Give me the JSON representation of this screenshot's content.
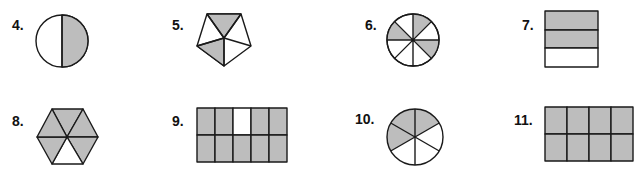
{
  "colors": {
    "shaded": "#bdbdbd",
    "unshaded": "#ffffff",
    "outline": "#1a1a1a"
  },
  "problems": [
    {
      "number": "4.",
      "shape": "circle",
      "parts": 2,
      "shaded": 1,
      "shaded_parts": [
        "right-half"
      ]
    },
    {
      "number": "5.",
      "shape": "pentagon",
      "parts": 5,
      "shaded": 2,
      "shaded_parts": [
        "top",
        "bottom-left"
      ]
    },
    {
      "number": "6.",
      "shape": "circle",
      "parts": 8,
      "shaded": 3,
      "shaded_parts": [
        "0-45deg",
        "90-135deg",
        "270-315deg"
      ]
    },
    {
      "number": "7.",
      "shape": "rectangle-rows",
      "parts": 3,
      "shaded": 2,
      "shaded_parts": [
        "row-1",
        "row-2"
      ]
    },
    {
      "number": "8.",
      "shape": "hexagon",
      "parts": 6,
      "shaded": 5,
      "shaded_parts": [
        "all-except-bottom"
      ]
    },
    {
      "number": "9.",
      "shape": "grid-5x2",
      "parts": 10,
      "shaded": 9,
      "shaded_parts": [
        "all-except-top-row-col-3"
      ]
    },
    {
      "number": "10.",
      "shape": "circle",
      "parts": 6,
      "shaded": 3,
      "shaded_parts": [
        "0-60deg",
        "240-300deg",
        "300-360deg"
      ]
    },
    {
      "number": "11.",
      "shape": "grid-4x2",
      "parts": 8,
      "shaded": 8,
      "shaded_parts": [
        "all"
      ]
    }
  ]
}
